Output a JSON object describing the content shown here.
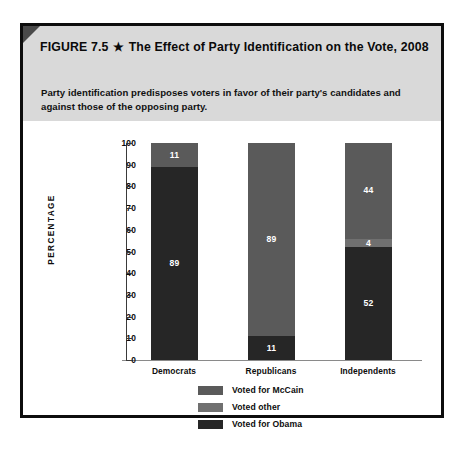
{
  "figure": {
    "number_label": "FIGURE 7.5",
    "star_icon": "star-icon",
    "star_glyph": "★",
    "title": "The Effect of Party Identification on the Vote, 2008",
    "subtitle": "Party identification predisposes voters in favor of their party's candidates and against those of the opposing party."
  },
  "chart_data": {
    "type": "bar",
    "subtype": "stacked-vertical-100",
    "title": "The Effect of Party Identification on the Vote, 2008",
    "xlabel": "",
    "ylabel": "PERCENTAGE",
    "ylim": [
      0,
      100
    ],
    "yticks": [
      0,
      10,
      20,
      30,
      40,
      50,
      60,
      70,
      80,
      90,
      100
    ],
    "grid": false,
    "legend_position": "bottom-center",
    "categories": [
      "Democrats",
      "Republicans",
      "Independents"
    ],
    "series": [
      {
        "name": "Voted for McCain",
        "color": "#5a5a5a",
        "values": [
          11,
          89,
          44
        ]
      },
      {
        "name": "Voted other",
        "color": "#707070",
        "values": [
          0,
          0,
          4
        ]
      },
      {
        "name": "Voted for Obama",
        "color": "#262626",
        "values": [
          89,
          11,
          52
        ]
      }
    ],
    "stack_order_bottom_to_top": [
      "Voted for Obama",
      "Voted other",
      "Voted for McCain"
    ],
    "bars": [
      {
        "category": "Democrats",
        "segments": [
          {
            "label": "Voted for Obama",
            "value": 89,
            "display": "89",
            "color": "#262626"
          },
          {
            "label": "Voted other",
            "value": 0,
            "display": "",
            "color": "#707070"
          },
          {
            "label": "Voted for McCain",
            "value": 11,
            "display": "11",
            "color": "#5a5a5a"
          }
        ]
      },
      {
        "category": "Republicans",
        "segments": [
          {
            "label": "Voted for Obama",
            "value": 11,
            "display": "11",
            "color": "#262626"
          },
          {
            "label": "Voted other",
            "value": 0,
            "display": "",
            "color": "#707070"
          },
          {
            "label": "Voted for McCain",
            "value": 89,
            "display": "89",
            "color": "#5a5a5a"
          }
        ]
      },
      {
        "category": "Independents",
        "segments": [
          {
            "label": "Voted for Obama",
            "value": 52,
            "display": "52",
            "color": "#262626"
          },
          {
            "label": "Voted other",
            "value": 4,
            "display": "4",
            "color": "#707070"
          },
          {
            "label": "Voted for McCain",
            "value": 44,
            "display": "44",
            "color": "#5a5a5a"
          }
        ]
      }
    ],
    "legend": [
      {
        "label": "Voted for McCain",
        "color": "#5a5a5a"
      },
      {
        "label": "Voted other",
        "color": "#707070"
      },
      {
        "label": "Voted for Obama",
        "color": "#262626"
      }
    ]
  },
  "colors": {
    "header_band": "#d9d9d9",
    "border": "#0d0d0d",
    "mccain": "#5a5a5a",
    "other": "#707070",
    "obama": "#262626",
    "axis": "#3a3a3a"
  }
}
